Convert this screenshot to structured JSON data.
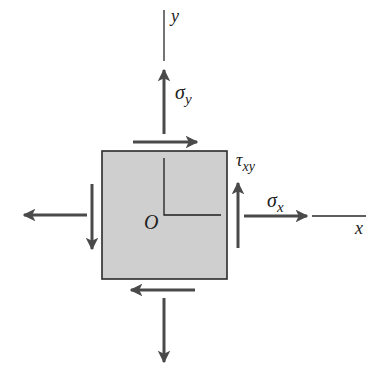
{
  "diagram": {
    "colors": {
      "element_fill": "#cfcfcf",
      "element_stroke": "#2a2a2a",
      "arrow": "#4a4a4a",
      "axis": "#2a2a2a",
      "text": "#222222"
    },
    "labels": {
      "y_axis": "y",
      "x_axis": "x",
      "origin": "O",
      "sigma_y_base": "σ",
      "sigma_y_sub": "y",
      "sigma_x_base": "σ",
      "sigma_x_sub": "x",
      "tau_base": "τ",
      "tau_sub": "xy"
    },
    "stresses": [
      {
        "name": "sigma_y",
        "direction": "up",
        "face": "top"
      },
      {
        "name": "sigma_y",
        "direction": "down",
        "face": "bottom"
      },
      {
        "name": "sigma_x",
        "direction": "right",
        "face": "right"
      },
      {
        "name": "sigma_x",
        "direction": "left",
        "face": "left"
      },
      {
        "name": "tau_xy",
        "direction": "right",
        "face": "top"
      },
      {
        "name": "tau_xy",
        "direction": "up",
        "face": "right"
      },
      {
        "name": "tau_xy",
        "direction": "left",
        "face": "bottom"
      },
      {
        "name": "tau_xy",
        "direction": "down",
        "face": "left"
      }
    ]
  }
}
